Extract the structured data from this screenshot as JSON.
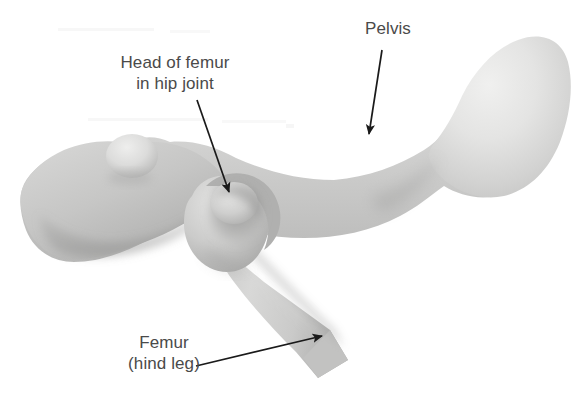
{
  "figure": {
    "kind": "anatomical-illustration",
    "background_color": "#ffffff",
    "label_text_color": "#4a4a4a",
    "annotation_color": "#1a1a1a",
    "bone_tones": {
      "highlight": "#ececeb",
      "light": "#dedede",
      "mid": "#c9c9c9",
      "shade": "#b4b4b4",
      "deep_shade": "#9e9e9e",
      "socket_shadow": "#8d8d8d"
    }
  },
  "labels": [
    {
      "id": "head-of-femur",
      "lines": [
        "Head of femur",
        "in hip joint"
      ],
      "line1": "Head of femur",
      "line2": "in hip joint"
    },
    {
      "id": "pelvis",
      "lines": [
        "Pelvis"
      ],
      "line1": "Pelvis"
    },
    {
      "id": "femur",
      "lines": [
        "Femur",
        "(hind leg)"
      ],
      "line1": "Femur",
      "line2": "(hind leg)"
    }
  ],
  "leader_lines": [
    {
      "id": "head-of-femur-arrow",
      "from": [
        197,
        100
      ],
      "to": [
        229,
        192
      ],
      "points_at": "femoral head seated in acetabulum"
    },
    {
      "id": "pelvis-arrow",
      "from": [
        382,
        50
      ],
      "to": [
        369,
        134
      ],
      "points_at": "iliac blade of pelvis"
    },
    {
      "id": "femur-arrow",
      "from": [
        196,
        366
      ],
      "to": [
        322,
        336
      ],
      "points_at": "femur shaft"
    }
  ],
  "structures": [
    {
      "id": "pelvis-plate",
      "name": "Pelvis (ilium plate, left)"
    },
    {
      "id": "pelvis-bump",
      "name": "Iliac tuberosity bump"
    },
    {
      "id": "pelvis-neck",
      "name": "Pelvic shaft / waist"
    },
    {
      "id": "pelvis-blade",
      "name": "Pelvis posterior blade"
    },
    {
      "id": "acetabulum",
      "name": "Hip socket (acetabulum)"
    },
    {
      "id": "femoral-head",
      "name": "Head of femur"
    },
    {
      "id": "greater-trochanter",
      "name": "Greater trochanter"
    },
    {
      "id": "femur-shaft",
      "name": "Femur shaft (hind leg)"
    },
    {
      "id": "femur-cut-end",
      "name": "Cut end of femur shaft"
    }
  ]
}
